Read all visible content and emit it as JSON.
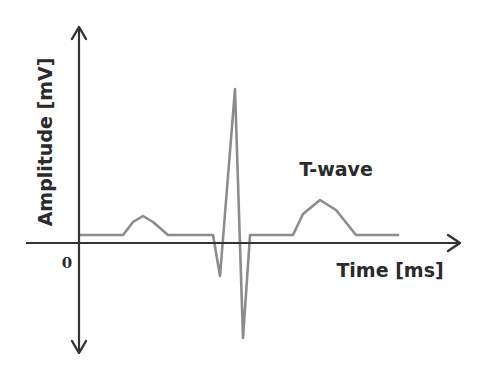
{
  "diagram": {
    "y_axis_label": "Amplitude [mV]",
    "x_axis_label": "Time [ms]",
    "origin_label": "0",
    "annotations": [
      {
        "text": "T-wave",
        "target": "T-wave peak"
      }
    ],
    "colors": {
      "axis": "#333333",
      "signal": "#8c8c8c",
      "text": "#2b2b2b"
    },
    "signal": {
      "description": "Single ECG heartbeat: baseline, P-wave bump, QRS complex (Q dip, tall R spike, deep S dip), flat ST segment, T-wave bump, baseline",
      "components": [
        "P-wave",
        "Q",
        "R",
        "S",
        "T-wave"
      ]
    }
  }
}
